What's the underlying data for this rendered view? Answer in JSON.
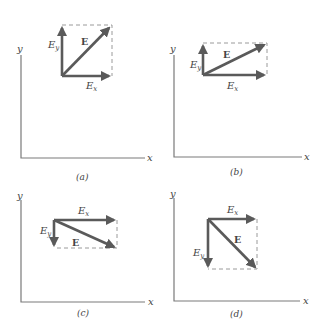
{
  "figure": {
    "colors": {
      "vector": "#5a5a5a",
      "axis": "#7a7a7a",
      "dashed": "#9a9a9a",
      "text": "#444444"
    },
    "panels": [
      {
        "id": "a",
        "caption": "(a)",
        "axis_x_label": "x",
        "axis_y_label": "y",
        "vector_label": "E",
        "component_x_label": "E",
        "component_x_sub": "x",
        "component_y_label": "E",
        "component_y_sub": "y",
        "direction": "Ex positive, Ey positive (equal magnitudes)"
      },
      {
        "id": "b",
        "caption": "(b)",
        "axis_x_label": "x",
        "axis_y_label": "y",
        "vector_label": "E",
        "component_x_label": "E",
        "component_x_sub": "x",
        "component_y_label": "E",
        "component_y_sub": "y",
        "direction": "Ex positive (large), Ey positive (small)"
      },
      {
        "id": "c",
        "caption": "(c)",
        "axis_x_label": "x",
        "axis_y_label": "y",
        "vector_label": "E",
        "component_x_label": "E",
        "component_x_sub": "x",
        "component_y_label": "E",
        "component_y_sub": "y",
        "direction": "Ex positive (large), Ey negative (small)"
      },
      {
        "id": "d",
        "caption": "(d)",
        "axis_x_label": "x",
        "axis_y_label": "y",
        "vector_label": "E",
        "component_x_label": "E",
        "component_x_sub": "x",
        "component_y_label": "E",
        "component_y_sub": "y",
        "direction": "Ex positive, Ey negative (equal magnitudes)"
      }
    ]
  }
}
